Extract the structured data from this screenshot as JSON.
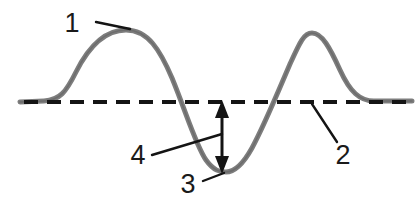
{
  "diagram": {
    "background_color": "#ffffff",
    "wave": {
      "name": "wave-curve",
      "stroke_color": "#7d7d7d",
      "stroke_width": 5,
      "cycles": 2,
      "crest_y": 30,
      "trough_y": 171,
      "rest_y": 102,
      "start_x": 20,
      "end_x": 412
    },
    "rest_line": {
      "name": "rest-position-line",
      "style": "dashed",
      "color": "#141414",
      "stroke_width": 4,
      "dash_length": 14,
      "gap_length": 9,
      "y": 102
    },
    "amplitude_arrow": {
      "name": "amplitude-double-arrow",
      "color": "#141414",
      "stroke_width": 3,
      "x": 222,
      "top_y": 102,
      "bottom_y": 172,
      "double_headed": true
    },
    "callouts": [
      {
        "id": "1",
        "label": "1",
        "meaning": "crest",
        "text_x": 72,
        "text_y": 32,
        "leader_from_x": 96,
        "leader_from_y": 22,
        "leader_to_x": 130,
        "leader_to_y": 29
      },
      {
        "id": "2",
        "label": "2",
        "meaning": "rest position line",
        "text_x": 334,
        "text_y": 160,
        "leader_from_x": 337,
        "leader_from_y": 142,
        "leader_to_x": 312,
        "leader_to_y": 104
      },
      {
        "id": "3",
        "label": "3",
        "meaning": "trough",
        "text_x": 180,
        "text_y": 192,
        "leader_from_x": 203,
        "leader_from_y": 180,
        "leader_to_x": 222,
        "leader_to_y": 172
      },
      {
        "id": "4",
        "label": "4",
        "meaning": "amplitude",
        "text_x": 129,
        "text_y": 163,
        "leader_from_x": 152,
        "leader_from_y": 155,
        "leader_to_x": 222,
        "leader_to_y": 134
      }
    ]
  }
}
